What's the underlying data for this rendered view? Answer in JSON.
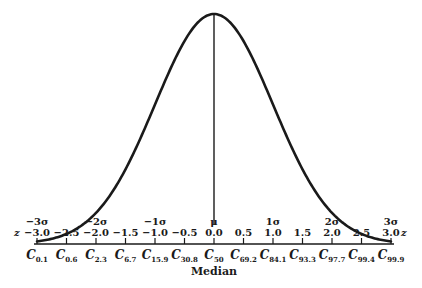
{
  "chart_data": {
    "type": "line",
    "title": "",
    "xlabel": "z",
    "ylabel": "",
    "xlim": [
      -3.0,
      3.0
    ],
    "grid": false,
    "curve": "normal density, mean 0, sd 1",
    "z_ticks": [
      -3.0,
      -2.5,
      -2.0,
      -1.5,
      -1.0,
      -0.5,
      0.0,
      0.5,
      1.0,
      1.5,
      2.0,
      2.5,
      3.0
    ],
    "z_tick_labels": [
      "-3.0",
      "-2.5",
      "-2.0",
      "-1.5",
      "-1.0",
      "-0.5",
      "0.0",
      "0.5",
      "1.0",
      "1.5",
      "2.0",
      "2.5",
      "3.0"
    ],
    "sigma_labels": [
      {
        "z": -3.0,
        "label": "-3σ"
      },
      {
        "z": -2.0,
        "label": "-2σ"
      },
      {
        "z": -1.0,
        "label": "-1σ"
      },
      {
        "z": 0.0,
        "label": "μ"
      },
      {
        "z": 1.0,
        "label": "1σ"
      },
      {
        "z": 2.0,
        "label": "2σ"
      },
      {
        "z": 3.0,
        "label": "3σ"
      }
    ],
    "centiles": [
      {
        "z": -3.0,
        "sub": "0.1"
      },
      {
        "z": -2.5,
        "sub": "0.6"
      },
      {
        "z": -2.0,
        "sub": "2.3"
      },
      {
        "z": -1.5,
        "sub": "6.7"
      },
      {
        "z": -1.0,
        "sub": "15.9"
      },
      {
        "z": -0.5,
        "sub": "30.8"
      },
      {
        "z": 0.0,
        "sub": "50"
      },
      {
        "z": 0.5,
        "sub": "69.2"
      },
      {
        "z": 1.0,
        "sub": "84.1"
      },
      {
        "z": 1.5,
        "sub": "93.3"
      },
      {
        "z": 2.0,
        "sub": "97.7"
      },
      {
        "z": 2.5,
        "sub": "99.4"
      },
      {
        "z": 3.0,
        "sub": "99.9"
      }
    ],
    "centile_letter": "C",
    "median_label": "Median",
    "axis_z_label_left": "z",
    "axis_z_label_right": "z"
  },
  "layout": {
    "x_center": 214,
    "px_per_z": 59,
    "axis_y": 244,
    "peak_y": 14,
    "stroke_color": "#1a1a1a"
  }
}
